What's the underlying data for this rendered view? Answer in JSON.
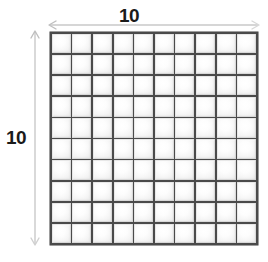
{
  "figure": {
    "kind": "area-model-grid",
    "grid": {
      "columns": 10,
      "rows": 10,
      "total_cells": 100,
      "line_color": "#4a4a4a",
      "cell_fill": "#ffffff",
      "cell_edge_color": "#d2d2d2"
    },
    "dimensions": {
      "top": {
        "label": "10",
        "arrow_style": "double-headed",
        "arrow_color": "#c9c9c9",
        "orientation": "horizontal"
      },
      "left": {
        "label": "10",
        "arrow_style": "double-headed",
        "arrow_color": "#c9c9c9",
        "orientation": "vertical"
      }
    },
    "background_color": "#ffffff"
  }
}
